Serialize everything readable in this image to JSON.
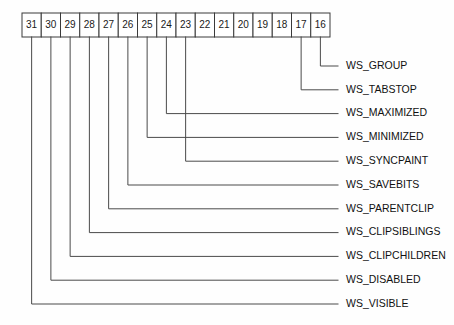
{
  "diagram": {
    "type": "bit-field-callout-diagram",
    "line_color": "#4a4a4a",
    "text_color": "#111111",
    "background": "#ffffff",
    "bits": [
      {
        "number": "31",
        "index": 0
      },
      {
        "number": "30",
        "index": 1
      },
      {
        "number": "29",
        "index": 2
      },
      {
        "number": "28",
        "index": 3
      },
      {
        "number": "27",
        "index": 4
      },
      {
        "number": "26",
        "index": 5
      },
      {
        "number": "25",
        "index": 6
      },
      {
        "number": "24",
        "index": 7
      },
      {
        "number": "23",
        "index": 8
      },
      {
        "number": "22",
        "index": 9
      },
      {
        "number": "21",
        "index": 10
      },
      {
        "number": "20",
        "index": 11
      },
      {
        "number": "19",
        "index": 12
      },
      {
        "number": "18",
        "index": 13
      },
      {
        "number": "17",
        "index": 14
      },
      {
        "number": "16",
        "index": 15
      }
    ],
    "callouts": [
      {
        "label": "WS_GROUP",
        "bit": "16",
        "bit_index": 15,
        "row": 0
      },
      {
        "label": "WS_TABSTOP",
        "bit": "17",
        "bit_index": 14,
        "row": 1
      },
      {
        "label": "WS_MAXIMIZED",
        "bit": "24",
        "bit_index": 7,
        "row": 2
      },
      {
        "label": "WS_MINIMIZED",
        "bit": "25",
        "bit_index": 6,
        "row": 3
      },
      {
        "label": "WS_SYNCPAINT",
        "bit": "23",
        "bit_index": 8,
        "row": 4
      },
      {
        "label": "WS_SAVEBITS",
        "bit": "26",
        "bit_index": 5,
        "row": 5
      },
      {
        "label": "WS_PARENTCLIP",
        "bit": "27",
        "bit_index": 4,
        "row": 6
      },
      {
        "label": "WS_CLIPSIBLINGS",
        "bit": "28",
        "bit_index": 3,
        "row": 7
      },
      {
        "label": "WS_CLIPCHILDREN",
        "bit": "29",
        "bit_index": 2,
        "row": 8
      },
      {
        "label": "WS_DISABLED",
        "bit": "30",
        "bit_index": 1,
        "row": 9
      },
      {
        "label": "WS_VISIBLE",
        "bit": "31",
        "bit_index": 0,
        "row": 10
      }
    ],
    "geometry": {
      "row_left": 22,
      "row_top": 13,
      "row_bottom": 37,
      "cell_width": 19.25,
      "label_x": 338,
      "first_row_y": 66,
      "row_spacing": 23.8,
      "elbow_x_start": 312
    }
  }
}
